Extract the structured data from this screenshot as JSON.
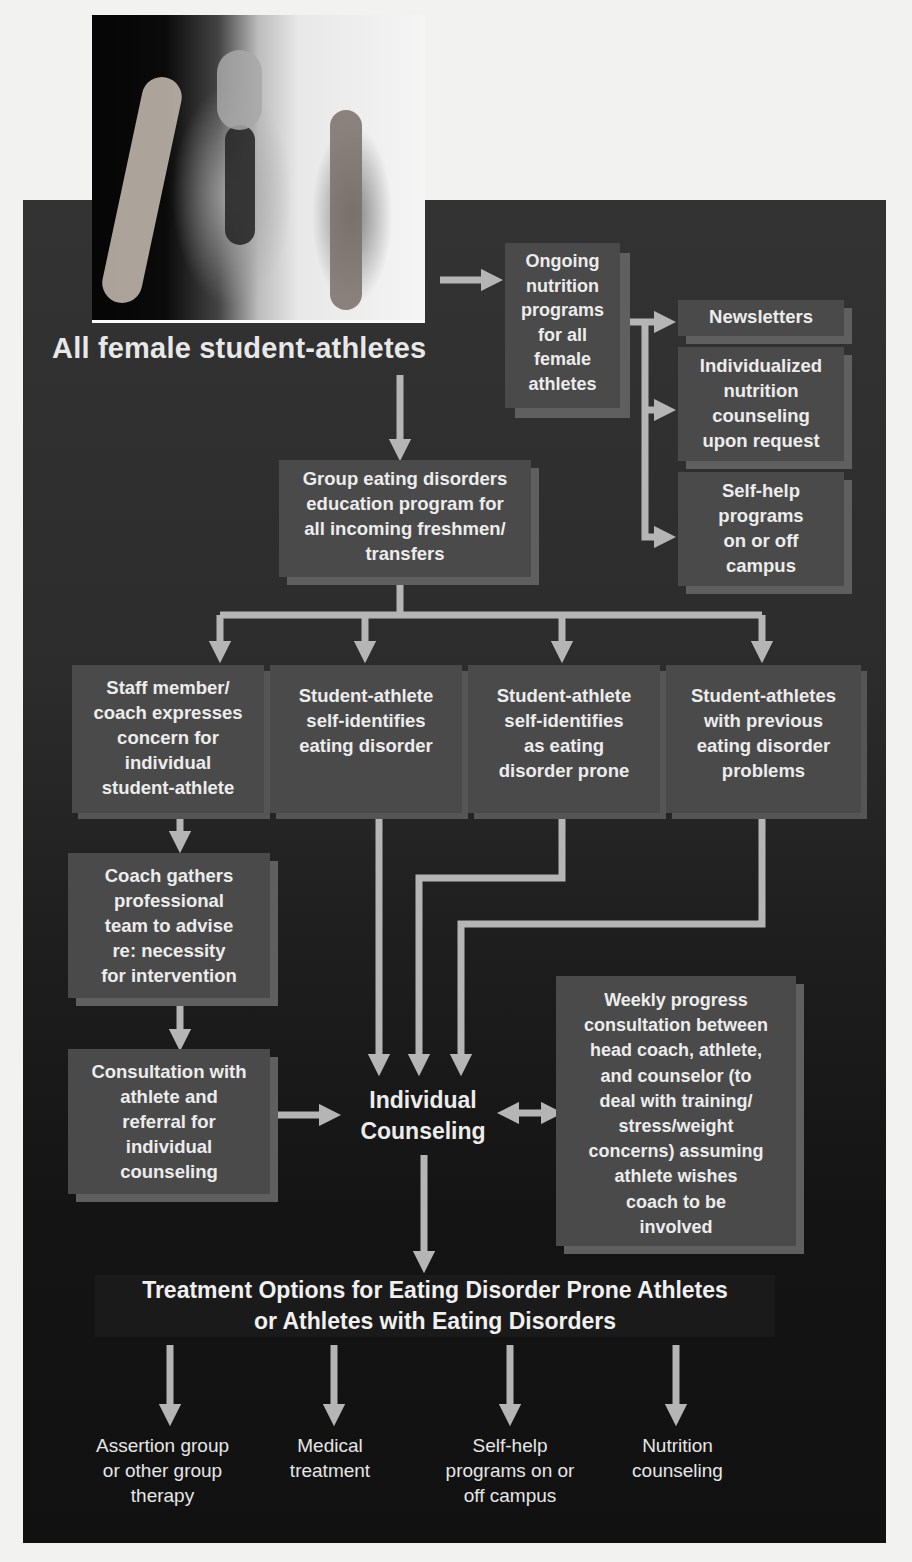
{
  "figure": {
    "photo_alt": "Female athletes: gymnast in handstand, runner, dancer",
    "root_label": "All female student-athletes"
  },
  "nutrition": {
    "ongoing": "Ongoing\nnutrition\nprograms\nfor all\nfemale\nathletes",
    "sub_items": [
      "Newsletters",
      "Individualized\nnutrition\ncounseling\nupon request",
      "Self-help\nprograms\non or off\ncampus"
    ]
  },
  "education": {
    "label": "Group eating disorders\neducation program for\nall incoming freshmen/\ntransfers"
  },
  "entry_points": [
    "Staff member/\ncoach expresses\nconcern for\nindividual\nstudent-athlete",
    "Student-athlete\nself-identifies\neating disorder",
    "Student-athlete\nself-identifies\nas eating\ndisorder prone",
    "Student-athletes\nwith previous\neating disorder\nproblems"
  ],
  "coach_path": [
    "Coach gathers\nprofessional\nteam to advise\nre: necessity\nfor intervention",
    "Consultation with\nathlete and\nreferral for\nindividual\ncounseling"
  ],
  "counseling": {
    "label": "Individual\nCounseling",
    "weekly": "Weekly progress\nconsultation between\nhead coach, athlete,\nand counselor (to\ndeal with training/\nstress/weight\nconcerns) assuming\nathlete wishes\ncoach to be\ninvolved"
  },
  "treatment": {
    "title": "Treatment Options for Eating Disorder Prone Athletes\nor Athletes with Eating Disorders",
    "options": [
      "Assertion group\nor other group\ntherapy",
      "Medical\ntreatment",
      "Self-help\nprograms on or\noff campus",
      "Nutrition\ncounseling"
    ]
  },
  "colors": {
    "panel": "#2c2c2c",
    "box": "#4a4a4a",
    "box_shadow": "#5f5f5f",
    "arrow": "#b5b5b5",
    "text": "#ececec"
  }
}
